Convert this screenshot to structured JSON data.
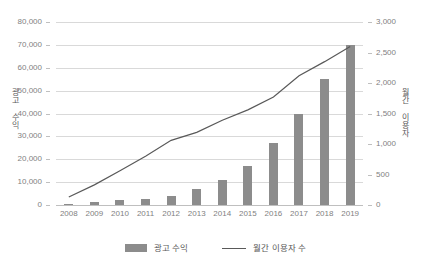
{
  "chart_data": {
    "type": "bar",
    "title": "",
    "subtitle": "",
    "xlabel": "",
    "ylabel": "광고 수익",
    "y2label": "월간 이용자",
    "categories": [
      "2008",
      "2009",
      "2010",
      "2011",
      "2012",
      "2013",
      "2014",
      "2015",
      "2016",
      "2017",
      "2018",
      "2019"
    ],
    "ylim": [
      0,
      80000
    ],
    "y2lim": [
      0,
      3000
    ],
    "yticks": [
      "0",
      "10,000",
      "20,000",
      "30,000",
      "40,000",
      "50,000",
      "60,000",
      "70,000",
      "80,000"
    ],
    "ytick_values": [
      0,
      10000,
      20000,
      30000,
      40000,
      50000,
      60000,
      70000,
      80000
    ],
    "y2ticks": [
      "0",
      "500",
      "1,000",
      "1,500",
      "2,000",
      "2,500",
      "3,000"
    ],
    "y2tick_values": [
      0,
      500,
      1000,
      1500,
      2000,
      2500,
      3000
    ],
    "grid": true,
    "legend_position": "bottom",
    "series": [
      {
        "name": "광고 수익",
        "type": "bar",
        "axis": "left",
        "color": "#8c8c8c",
        "values": [
          300,
          1200,
          2000,
          2600,
          4000,
          6800,
          11000,
          17000,
          27000,
          40000,
          55000,
          70000
        ]
      },
      {
        "name": "월간 이용자 수",
        "type": "line",
        "axis": "right",
        "color": "#595959",
        "values": [
          130,
          330,
          560,
          800,
          1060,
          1190,
          1390,
          1560,
          1770,
          2120,
          2350,
          2600
        ]
      }
    ],
    "legend": [
      "광고 수익",
      "월간 이용자 수"
    ]
  }
}
